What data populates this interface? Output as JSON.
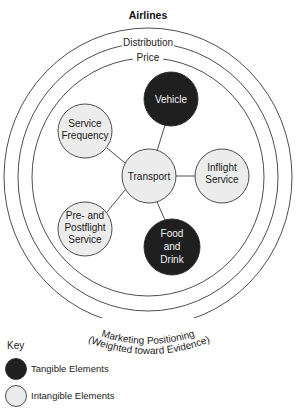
{
  "diagram": {
    "title": "Airlines",
    "rings": [
      {
        "id": "outer",
        "label": "Marketing Positioning",
        "label_line2": "(Weighted toward Evidence)"
      },
      {
        "id": "middle",
        "label": "Distribution"
      },
      {
        "id": "inner",
        "label": "Price"
      }
    ],
    "nodes": [
      {
        "id": "vehicle",
        "lines": [
          "Vehicle"
        ],
        "type": "tangible"
      },
      {
        "id": "service-frequency",
        "lines": [
          "Service",
          "Frequency"
        ],
        "type": "intangible"
      },
      {
        "id": "transport",
        "lines": [
          "Transport"
        ],
        "type": "intangible"
      },
      {
        "id": "inflight-service",
        "lines": [
          "Inflight",
          "Service"
        ],
        "type": "intangible"
      },
      {
        "id": "pre-postflight-service",
        "lines": [
          "Pre- and",
          "Postflight",
          "Service"
        ],
        "type": "intangible"
      },
      {
        "id": "food-and-drink",
        "lines": [
          "Food",
          "and",
          "Drink"
        ],
        "type": "tangible"
      }
    ],
    "edges": [
      [
        "transport",
        "vehicle"
      ],
      [
        "transport",
        "service-frequency"
      ],
      [
        "transport",
        "inflight-service"
      ],
      [
        "transport",
        "pre-postflight-service"
      ],
      [
        "transport",
        "food-and-drink"
      ]
    ],
    "colors": {
      "tangible": "#1f1f1f",
      "intangible": "#ececec"
    }
  },
  "key": {
    "title": "Key",
    "items": [
      {
        "label": "Tangible Elements",
        "type": "tangible"
      },
      {
        "label": "Intangible Elements",
        "type": "intangible"
      }
    ]
  }
}
